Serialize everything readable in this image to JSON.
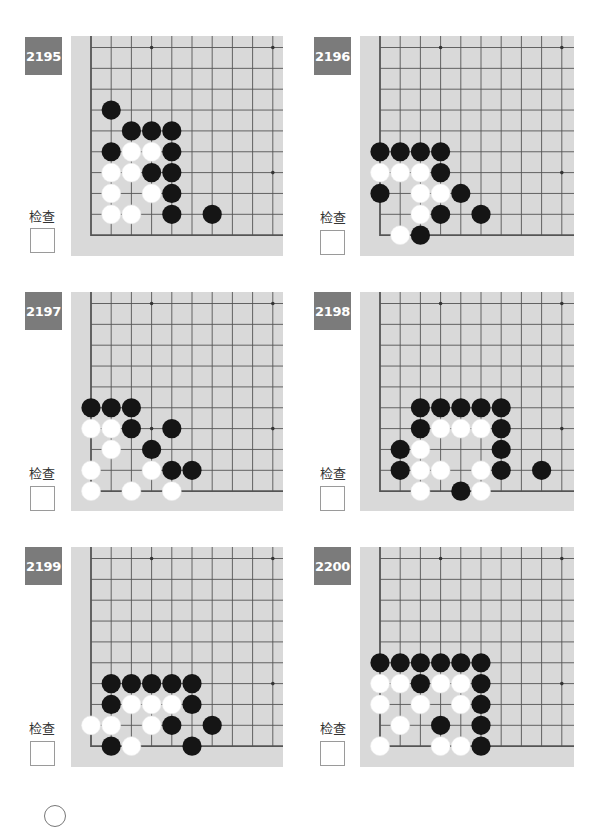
{
  "page": {
    "check_label": "检查",
    "colors": {
      "tag_bg": "#7b7b7b",
      "board_bg": "#d9d9d9",
      "grid_line": "#555555",
      "black_stone": "#151515",
      "white_stone": "#ffffff"
    }
  },
  "problems": [
    {
      "number": "2195",
      "check_label": "检查",
      "star_points": [
        [
          3,
          0
        ],
        [
          9,
          0
        ],
        [
          9,
          6
        ]
      ],
      "black": [
        [
          1,
          3
        ],
        [
          2,
          4
        ],
        [
          3,
          4
        ],
        [
          4,
          4
        ],
        [
          1,
          5
        ],
        [
          4,
          5
        ],
        [
          3,
          6
        ],
        [
          4,
          6
        ],
        [
          4,
          7
        ],
        [
          4,
          8
        ],
        [
          6,
          8
        ]
      ],
      "white": [
        [
          2,
          5
        ],
        [
          3,
          5
        ],
        [
          1,
          6
        ],
        [
          2,
          6
        ],
        [
          1,
          7
        ],
        [
          3,
          7
        ],
        [
          1,
          8
        ],
        [
          2,
          8
        ]
      ]
    },
    {
      "number": "2196",
      "check_label": "检查",
      "star_points": [
        [
          3,
          0
        ],
        [
          9,
          0
        ],
        [
          9,
          6
        ]
      ],
      "black": [
        [
          0,
          5
        ],
        [
          1,
          5
        ],
        [
          2,
          5
        ],
        [
          3,
          5
        ],
        [
          3,
          6
        ],
        [
          0,
          7
        ],
        [
          4,
          7
        ],
        [
          3,
          8
        ],
        [
          5,
          8
        ],
        [
          2,
          9
        ]
      ],
      "white": [
        [
          0,
          6
        ],
        [
          1,
          6
        ],
        [
          2,
          6
        ],
        [
          2,
          7
        ],
        [
          3,
          7
        ],
        [
          2,
          8
        ],
        [
          1,
          9
        ]
      ]
    },
    {
      "number": "2197",
      "check_label": "检查",
      "star_points": [
        [
          3,
          0
        ],
        [
          9,
          0
        ],
        [
          3,
          6
        ],
        [
          9,
          6
        ]
      ],
      "black": [
        [
          0,
          5
        ],
        [
          1,
          5
        ],
        [
          2,
          5
        ],
        [
          2,
          6
        ],
        [
          4,
          6
        ],
        [
          3,
          7
        ],
        [
          4,
          8
        ],
        [
          5,
          8
        ]
      ],
      "white": [
        [
          0,
          6
        ],
        [
          1,
          6
        ],
        [
          1,
          7
        ],
        [
          0,
          8
        ],
        [
          3,
          8
        ],
        [
          0,
          9
        ],
        [
          2,
          9
        ],
        [
          4,
          9
        ]
      ]
    },
    {
      "number": "2198",
      "check_label": "检查",
      "star_points": [
        [
          3,
          0
        ],
        [
          9,
          0
        ],
        [
          9,
          6
        ]
      ],
      "black": [
        [
          2,
          5
        ],
        [
          3,
          5
        ],
        [
          4,
          5
        ],
        [
          5,
          5
        ],
        [
          6,
          5
        ],
        [
          2,
          6
        ],
        [
          6,
          6
        ],
        [
          1,
          7
        ],
        [
          6,
          7
        ],
        [
          1,
          8
        ],
        [
          6,
          8
        ],
        [
          8,
          8
        ],
        [
          4,
          9
        ]
      ],
      "white": [
        [
          3,
          6
        ],
        [
          4,
          6
        ],
        [
          5,
          6
        ],
        [
          2,
          7
        ],
        [
          2,
          8
        ],
        [
          3,
          8
        ],
        [
          5,
          8
        ],
        [
          2,
          9
        ],
        [
          5,
          9
        ]
      ]
    },
    {
      "number": "2199",
      "check_label": "检查",
      "star_points": [
        [
          3,
          0
        ],
        [
          9,
          0
        ],
        [
          9,
          6
        ]
      ],
      "black": [
        [
          1,
          6
        ],
        [
          2,
          6
        ],
        [
          3,
          6
        ],
        [
          4,
          6
        ],
        [
          5,
          6
        ],
        [
          1,
          7
        ],
        [
          5,
          7
        ],
        [
          4,
          8
        ],
        [
          6,
          8
        ],
        [
          1,
          9
        ],
        [
          5,
          9
        ]
      ],
      "white": [
        [
          2,
          7
        ],
        [
          3,
          7
        ],
        [
          4,
          7
        ],
        [
          0,
          8
        ],
        [
          1,
          8
        ],
        [
          3,
          8
        ],
        [
          2,
          9
        ]
      ]
    },
    {
      "number": "2200",
      "check_label": "检查",
      "star_points": [
        [
          3,
          0
        ],
        [
          9,
          0
        ],
        [
          9,
          6
        ]
      ],
      "black": [
        [
          0,
          5
        ],
        [
          1,
          5
        ],
        [
          2,
          5
        ],
        [
          3,
          5
        ],
        [
          4,
          5
        ],
        [
          5,
          5
        ],
        [
          2,
          6
        ],
        [
          5,
          6
        ],
        [
          5,
          7
        ],
        [
          3,
          8
        ],
        [
          5,
          8
        ],
        [
          5,
          9
        ]
      ],
      "white": [
        [
          0,
          6
        ],
        [
          1,
          6
        ],
        [
          3,
          6
        ],
        [
          4,
          6
        ],
        [
          0,
          7
        ],
        [
          2,
          7
        ],
        [
          4,
          7
        ],
        [
          1,
          8
        ],
        [
          0,
          9
        ],
        [
          3,
          9
        ],
        [
          4,
          9
        ]
      ]
    }
  ]
}
